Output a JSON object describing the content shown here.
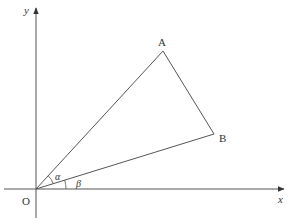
{
  "diagram": {
    "type": "coordinate-geometry",
    "axes": {
      "x_label": "x",
      "y_label": "y",
      "origin_label": "O"
    },
    "points": [
      {
        "label": "A",
        "px": [
          163,
          51
        ]
      },
      {
        "label": "B",
        "px": [
          214,
          134
        ]
      }
    ],
    "segments": [
      "OA",
      "OB",
      "AB"
    ],
    "angles": [
      {
        "label": "α",
        "between": [
          "OA",
          "OB"
        ]
      },
      {
        "label": "β",
        "between": [
          "OB",
          "x-axis"
        ]
      }
    ],
    "line_color": "#555555",
    "text_color": "#333333"
  }
}
